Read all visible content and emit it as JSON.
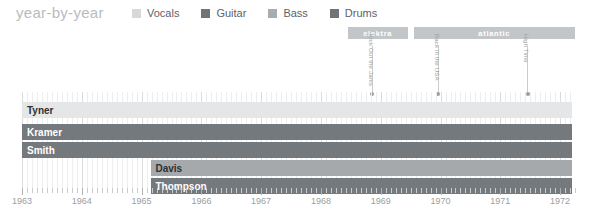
{
  "header": {
    "title": "year-by-year"
  },
  "legend": {
    "items": [
      {
        "label": "Vocals",
        "color": "#d6d8da",
        "icon": "square-swatch"
      },
      {
        "label": "Guitar",
        "color": "#6e7477",
        "icon": "square-swatch"
      },
      {
        "label": "Bass",
        "color": "#a8acae",
        "icon": "square-swatch"
      },
      {
        "label": "Drums",
        "color": "#6e7477",
        "icon": "square-swatch"
      }
    ]
  },
  "chart_data": {
    "type": "bar",
    "title": "year-by-year",
    "xlabel": "",
    "ylabel": "",
    "xlim": [
      1963,
      1972
    ],
    "grid": true,
    "legend_position": "top",
    "tick_labels": [
      "1963",
      "1964",
      "1965",
      "1966",
      "1967",
      "1968",
      "1969",
      "1970",
      "1971",
      "1972"
    ],
    "minor_ticks_per_year": 12,
    "categories": [
      "Tyner",
      "Kramer",
      "Smith",
      "Davis",
      "Thompson"
    ],
    "series": [
      {
        "name": "Tyner",
        "role": "Vocals",
        "color": "#e4e6e7",
        "text_color": "#2e3133",
        "start": 1963.0,
        "end": 1972.2
      },
      {
        "name": "Kramer",
        "role": "Guitar",
        "color": "#73797c",
        "text_color": "#ffffff",
        "start": 1963.0,
        "end": 1972.2
      },
      {
        "name": "Smith",
        "role": "Guitar",
        "color": "#73797c",
        "text_color": "#ffffff",
        "start": 1963.0,
        "end": 1972.2
      },
      {
        "name": "Davis",
        "role": "Bass",
        "color": "#a5a9ac",
        "text_color": "#2e3133",
        "start": 1965.15,
        "end": 1972.2
      },
      {
        "name": "Thompson",
        "role": "Drums",
        "color": "#73797c",
        "text_color": "#ffffff",
        "start": 1965.15,
        "end": 1972.2
      }
    ],
    "record_labels": [
      {
        "name": "elektra",
        "color": "#c3c6c8",
        "start": 1968.45,
        "end": 1969.45
      },
      {
        "name": "atlantic",
        "color": "#c3c6c8",
        "start": 1969.55,
        "end": 1972.25
      }
    ],
    "albums": [
      {
        "name": "Kick Out the Jams",
        "year": 1968.85
      },
      {
        "name": "Back in the USA",
        "year": 1969.95
      },
      {
        "name": "High Time",
        "year": 1971.45
      }
    ]
  }
}
